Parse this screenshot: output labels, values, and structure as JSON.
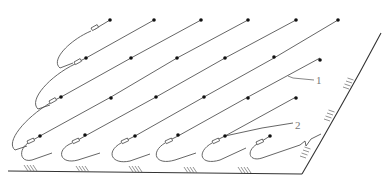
{
  "diagram": {
    "type": "pipe-layout-on-slope",
    "labels": {
      "callout_1": "1",
      "callout_2": "2"
    },
    "colors": {
      "line": "#555555",
      "dot": "#111111",
      "background": "#ffffff"
    },
    "nozzle_rows": [
      {
        "y": 20,
        "x": [
          110,
          154,
          201,
          248,
          296,
          338
        ]
      },
      {
        "y": 58,
        "x": [
          86,
          131,
          177,
          225,
          274,
          320
        ]
      },
      {
        "y": 97,
        "x": [
          61,
          111,
          156,
          204,
          248,
          296
        ]
      },
      {
        "y": 136,
        "x": [
          40,
          85,
          135,
          178,
          225,
          270
        ]
      }
    ],
    "ground_hatch_x": [
      28,
      80,
      133,
      190,
      243
    ],
    "wall_hatch_points": [
      [
        306,
        158
      ],
      [
        330,
        118
      ],
      [
        348,
        84
      ]
    ]
  }
}
